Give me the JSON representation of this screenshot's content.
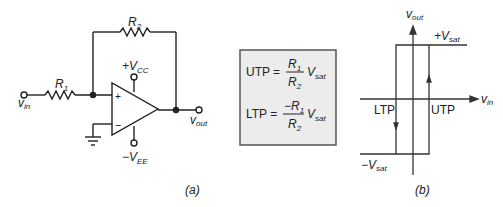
{
  "circuit": {
    "r1_label": "R",
    "r1_sub": "1",
    "r2_label": "R",
    "r2_sub": "2",
    "vcc_label": "+V",
    "vcc_sub": "CC",
    "vee_label": "−V",
    "vee_sub": "EE",
    "vin_label": "v",
    "vin_sub": "in",
    "vout_label": "v",
    "vout_sub": "out",
    "plus_sign": "+",
    "minus_sign": "−",
    "caption": "(a)"
  },
  "formulas": {
    "utp": {
      "lhs": "UTP =",
      "num": "R",
      "num_sub": "1",
      "den": "R",
      "den_sub": "2",
      "factor": "V",
      "factor_sub": "sat"
    },
    "ltp": {
      "lhs": "LTP =",
      "num": "−R",
      "num_sub": "1",
      "den": "R",
      "den_sub": "2",
      "factor": "V",
      "factor_sub": "sat"
    }
  },
  "graph": {
    "y_axis_label": "v",
    "y_axis_sub": "out",
    "x_axis_label": "v",
    "x_axis_sub": "in",
    "pos_sat_label": "+V",
    "pos_sat_sub": "sat",
    "neg_sat_label": "−V",
    "neg_sat_sub": "sat",
    "ltp_label": "LTP",
    "utp_label": "UTP",
    "caption": "(b)"
  }
}
